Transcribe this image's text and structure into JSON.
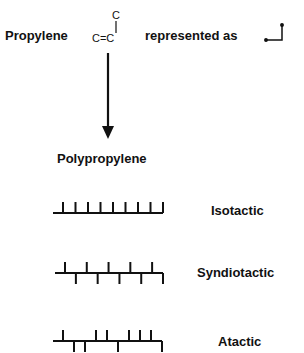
{
  "header": {
    "monomer_label": "Propylene",
    "represented_label": "represented as",
    "structure_top_atom": "C",
    "structure_double_bond": "C=C"
  },
  "product_label": "Polypropylene",
  "tacticity": [
    {
      "name": "Isotactic",
      "pattern": [
        "up",
        "up",
        "up",
        "up",
        "up",
        "up",
        "up",
        "up",
        "up"
      ]
    },
    {
      "name": "Syndiotactic",
      "pattern": [
        "up",
        "down",
        "up",
        "down",
        "up",
        "down",
        "up",
        "down",
        "up",
        "down"
      ]
    },
    {
      "name": "Atactic",
      "pattern": [
        "up",
        "down",
        "down",
        "up",
        "up",
        "down",
        "up",
        "up",
        "up",
        "down"
      ]
    }
  ],
  "colors": {
    "ink": "#111111",
    "background": "#ffffff"
  }
}
